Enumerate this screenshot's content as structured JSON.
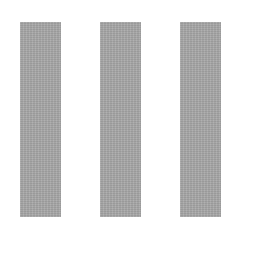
{
  "canvas": {
    "width": 260,
    "height": 271,
    "background": "#ffffff"
  },
  "bars": [
    {
      "left": 20,
      "top": 22,
      "width": 41,
      "height": 195,
      "color": "#a8a8a8"
    },
    {
      "left": 100,
      "top": 22,
      "width": 41,
      "height": 195,
      "color": "#a8a8a8"
    },
    {
      "left": 180,
      "top": 22,
      "width": 41,
      "height": 195,
      "color": "#a8a8a8"
    }
  ]
}
